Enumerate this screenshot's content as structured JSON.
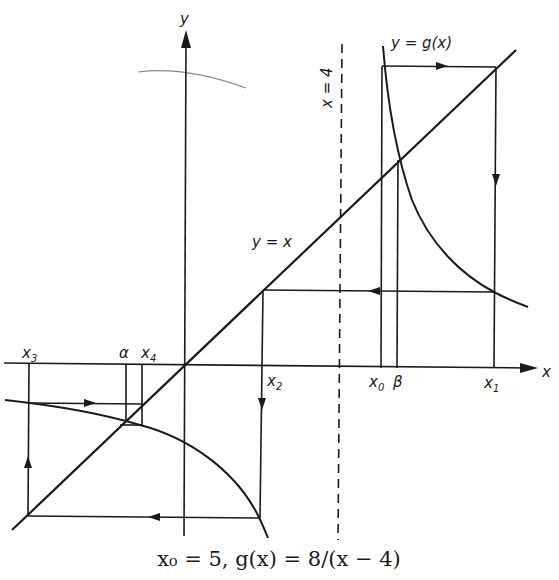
{
  "diagram": {
    "axes": {
      "x_label": "x",
      "y_label": "y"
    },
    "curves": {
      "identity_label": "y = x",
      "g_label": "y = g(x)",
      "asymptote_label": "x = 4"
    },
    "points": {
      "x0": {
        "base": "x",
        "sub": "0"
      },
      "x1": {
        "base": "x",
        "sub": "1"
      },
      "x2": {
        "base": "x",
        "sub": "2"
      },
      "x3": {
        "base": "x",
        "sub": "3"
      },
      "x4": {
        "base": "x",
        "sub": "4"
      },
      "alpha": "α",
      "beta": "β"
    },
    "caption": "x₀ = 5, g(x) = 8/(x − 4)",
    "colors": {
      "ink": "#1a1a1a",
      "faint_arc": "#8a8a8a",
      "background": "#ffffff"
    }
  }
}
